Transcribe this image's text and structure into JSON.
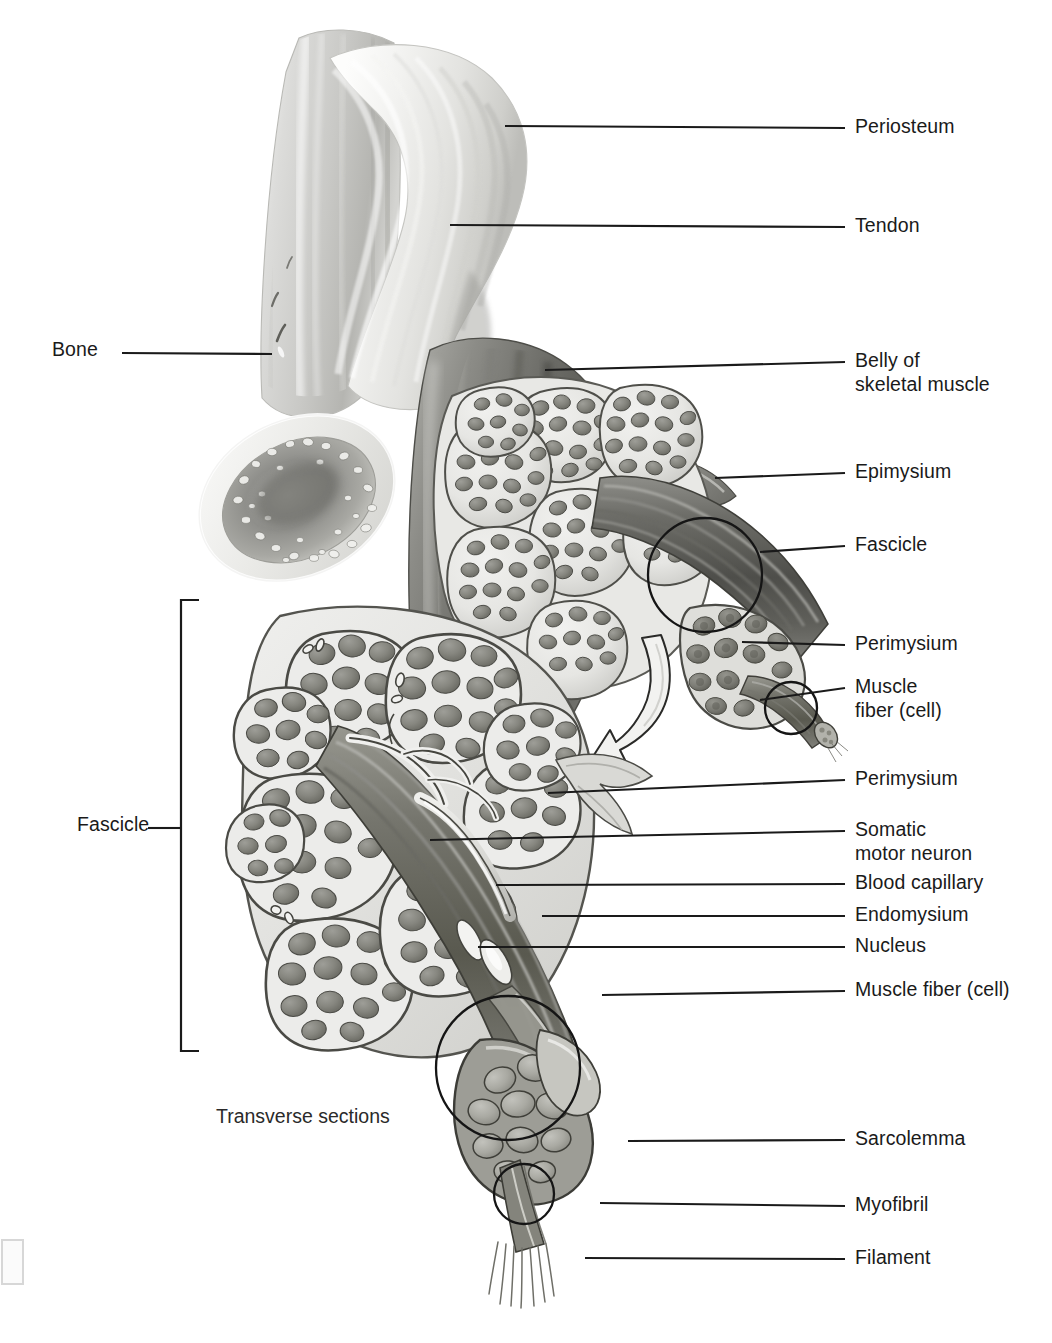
{
  "figure": {
    "caption": "Transverse sections",
    "background_color": "#ffffff",
    "line_color": "#1a1a1a"
  },
  "labels_right": [
    {
      "id": "periosteum",
      "text": "Periosteum",
      "y": 128,
      "lead_x1": 505,
      "lead_y1": 126,
      "lead_x2": 845,
      "lead_y2": 128
    },
    {
      "id": "tendon",
      "text": "Tendon",
      "y": 227,
      "lead_x1": 450,
      "lead_y1": 225,
      "lead_x2": 845,
      "lead_y2": 227
    },
    {
      "id": "belly-line1",
      "text": "Belly of",
      "y": 362,
      "lead_x1": 545,
      "lead_y1": 370,
      "lead_x2": 845,
      "lead_y2": 362
    },
    {
      "id": "belly-line2",
      "text": "skeletal muscle",
      "y": 386,
      "lead_x1": 0,
      "lead_y1": 0,
      "lead_x2": 0,
      "lead_y2": 0
    },
    {
      "id": "epimysium",
      "text": "Epimysium",
      "y": 473,
      "lead_x1": 715,
      "lead_y1": 478,
      "lead_x2": 845,
      "lead_y2": 473
    },
    {
      "id": "fascicle-right",
      "text": "Fascicle",
      "y": 546,
      "lead_x1": 760,
      "lead_y1": 552,
      "lead_x2": 845,
      "lead_y2": 546
    },
    {
      "id": "perimysium-upper",
      "text": "Perimysium",
      "y": 645,
      "lead_x1": 742,
      "lead_y1": 642,
      "lead_x2": 845,
      "lead_y2": 645
    },
    {
      "id": "musclefiber-line1",
      "text": "Muscle",
      "y": 688,
      "lead_x1": 760,
      "lead_y1": 700,
      "lead_x2": 845,
      "lead_y2": 688
    },
    {
      "id": "musclefiber-line2",
      "text": "fiber (cell)",
      "y": 712,
      "lead_x1": 0,
      "lead_y1": 0,
      "lead_x2": 0,
      "lead_y2": 0
    },
    {
      "id": "perimysium-lower",
      "text": "Perimysium",
      "y": 780,
      "lead_x1": 548,
      "lead_y1": 793,
      "lead_x2": 845,
      "lead_y2": 780
    },
    {
      "id": "somatic-line1",
      "text": "Somatic",
      "y": 831,
      "lead_x1": 430,
      "lead_y1": 840,
      "lead_x2": 845,
      "lead_y2": 831
    },
    {
      "id": "somatic-line2",
      "text": "motor neuron",
      "y": 855,
      "lead_x1": 0,
      "lead_y1": 0,
      "lead_x2": 0,
      "lead_y2": 0
    },
    {
      "id": "blood-capillary",
      "text": "Blood capillary",
      "y": 884,
      "lead_x1": 496,
      "lead_y1": 885,
      "lead_x2": 845,
      "lead_y2": 884
    },
    {
      "id": "endomysium",
      "text": "Endomysium",
      "y": 916,
      "lead_x1": 542,
      "lead_y1": 916,
      "lead_x2": 845,
      "lead_y2": 916
    },
    {
      "id": "nucleus",
      "text": "Nucleus",
      "y": 947,
      "lead_x1": 478,
      "lead_y1": 947,
      "lead_x2": 845,
      "lead_y2": 947
    },
    {
      "id": "musclefiber-cell",
      "text": "Muscle fiber (cell)",
      "y": 991,
      "lead_x1": 602,
      "lead_y1": 995,
      "lead_x2": 845,
      "lead_y2": 991
    },
    {
      "id": "sarcolemma",
      "text": "Sarcolemma",
      "y": 1140,
      "lead_x1": 628,
      "lead_y1": 1141,
      "lead_x2": 845,
      "lead_y2": 1140
    },
    {
      "id": "myofibril",
      "text": "Myofibril",
      "y": 1206,
      "lead_x1": 600,
      "lead_y1": 1203,
      "lead_x2": 845,
      "lead_y2": 1206
    },
    {
      "id": "filament",
      "text": "Filament",
      "y": 1259,
      "lead_x1": 585,
      "lead_y1": 1258,
      "lead_x2": 845,
      "lead_y2": 1259
    }
  ],
  "labels_left": [
    {
      "id": "bone",
      "text": "Bone",
      "x": 52,
      "y": 351,
      "lead_x1": 122,
      "lead_y1": 353,
      "lead_x2": 272,
      "lead_y2": 354
    },
    {
      "id": "fascicle-left",
      "text": "Fascicle",
      "x": 77,
      "y": 826,
      "lead_x1": 148,
      "lead_y1": 828,
      "lead_x2": 180,
      "lead_y2": 828
    }
  ],
  "bracket": {
    "id": "fascicle-bracket",
    "x": 181,
    "y_top": 600,
    "y_bottom": 1051,
    "tick_len": 18
  },
  "caption": {
    "text": "Transverse sections",
    "x": 216,
    "y": 1105
  },
  "structures": [
    {
      "id": "bone",
      "name": "Bone with cut end showing spongy bone"
    },
    {
      "id": "periosteum",
      "name": "Periosteum membrane over bone"
    },
    {
      "id": "tendon",
      "name": "Tendon connecting bone to muscle"
    },
    {
      "id": "muscle-belly",
      "name": "Belly of skeletal muscle"
    },
    {
      "id": "epimysium",
      "name": "Epimysium sheath around whole muscle"
    },
    {
      "id": "fascicle-bundle",
      "name": "Fascicle bundles in transverse section"
    },
    {
      "id": "perimysium",
      "name": "Perimysium around each fascicle"
    },
    {
      "id": "muscle-fiber",
      "name": "Single muscle fiber (cell)"
    },
    {
      "id": "somatic-motor-neuron",
      "name": "Somatic motor neuron axon"
    },
    {
      "id": "blood-capillary",
      "name": "Blood capillary"
    },
    {
      "id": "endomysium",
      "name": "Endomysium around each fiber"
    },
    {
      "id": "nucleus",
      "name": "Peripheral nucleus of muscle fiber"
    },
    {
      "id": "sarcolemma",
      "name": "Sarcolemma plasma membrane"
    },
    {
      "id": "myofibril",
      "name": "Myofibril within muscle fiber"
    },
    {
      "id": "filament",
      "name": "Myofilaments"
    },
    {
      "id": "magnify-arrow",
      "name": "Curved magnification arrow"
    },
    {
      "id": "circle-callout",
      "name": "Circular magnification callouts"
    }
  ]
}
